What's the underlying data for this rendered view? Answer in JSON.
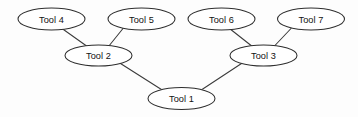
{
  "diagram": {
    "type": "node-link-graph",
    "background_color": "#fdfdfd",
    "node_fill_color": "#ffffff",
    "node_stroke_color": "#2e2e2e",
    "edge_color": "#3a3a3a",
    "text_color": "#121212",
    "nodes": [
      {
        "id": "tool1",
        "label": "Tool 1",
        "cx": 181.5,
        "cy": 98.5,
        "rx": 33.5,
        "ry": 11.0,
        "level": 0
      },
      {
        "id": "tool2",
        "label": "Tool 2",
        "cx": 98.5,
        "cy": 55.5,
        "rx": 33.5,
        "ry": 10.5,
        "level": 1
      },
      {
        "id": "tool3",
        "label": "Tool 3",
        "cx": 263.5,
        "cy": 55.5,
        "rx": 33.5,
        "ry": 10.5,
        "level": 1
      },
      {
        "id": "tool4",
        "label": "Tool 4",
        "cx": 51.5,
        "cy": 19.0,
        "rx": 33.5,
        "ry": 11.0,
        "level": 2
      },
      {
        "id": "tool5",
        "label": "Tool 5",
        "cx": 141.5,
        "cy": 19.0,
        "rx": 33.5,
        "ry": 11.0,
        "level": 2
      },
      {
        "id": "tool6",
        "label": "Tool 6",
        "cx": 221.5,
        "cy": 19.0,
        "rx": 33.5,
        "ry": 11.0,
        "level": 2
      },
      {
        "id": "tool7",
        "label": "Tool 7",
        "cx": 311.0,
        "cy": 19.0,
        "rx": 33.5,
        "ry": 11.0,
        "level": 2
      }
    ],
    "edges": [
      {
        "id": "edge-tool4-tool2",
        "from": "tool4",
        "to": "tool2",
        "x1": 62.0,
        "y1": 28.5,
        "x2": 88.0,
        "y2": 47.0
      },
      {
        "id": "edge-tool5-tool2",
        "from": "tool5",
        "to": "tool2",
        "x1": 123.0,
        "y1": 28.5,
        "x2": 108.5,
        "y2": 46.5
      },
      {
        "id": "edge-tool6-tool3",
        "from": "tool6",
        "to": "tool3",
        "x1": 229.5,
        "y1": 28.5,
        "x2": 253.0,
        "y2": 47.0
      },
      {
        "id": "edge-tool7-tool3",
        "from": "tool7",
        "to": "tool3",
        "x1": 291.0,
        "y1": 28.5,
        "x2": 274.0,
        "y2": 46.5
      },
      {
        "id": "edge-tool2-tool1",
        "from": "tool2",
        "to": "tool1",
        "x1": 120.5,
        "y1": 63.5,
        "x2": 163.0,
        "y2": 90.5
      },
      {
        "id": "edge-tool3-tool1",
        "from": "tool3",
        "to": "tool1",
        "x1": 241.5,
        "y1": 63.5,
        "x2": 200.5,
        "y2": 90.5
      }
    ]
  }
}
